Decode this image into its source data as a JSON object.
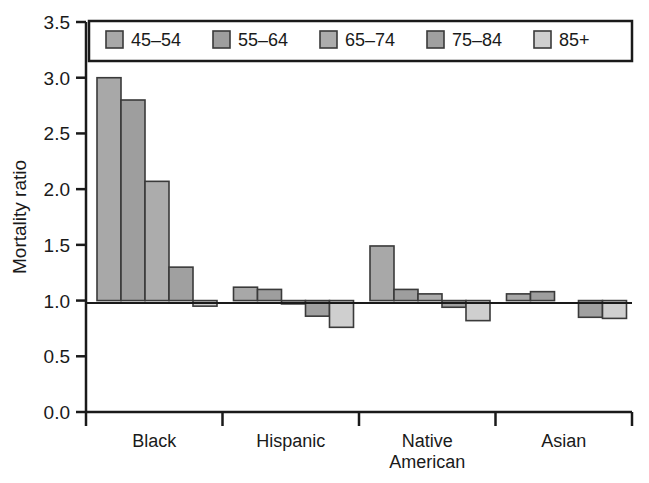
{
  "chart_data": {
    "type": "bar",
    "title": "",
    "subtitle": "",
    "xlabel": "",
    "ylabel": "Mortality ratio",
    "ylim": [
      0.0,
      3.5
    ],
    "ytick_labels": [
      "0.0",
      "0.5",
      "1.0",
      "1.5",
      "2.0",
      "2.5",
      "3.0",
      "3.5"
    ],
    "ytick_values": [
      0.0,
      0.5,
      1.0,
      1.5,
      2.0,
      2.5,
      3.0,
      3.5
    ],
    "grid": false,
    "legend_position": "top-inside",
    "reference_line": 1.0,
    "categories": [
      "Black",
      "Hispanic",
      "Native American",
      "Asian"
    ],
    "category_label_lines": [
      [
        "Black"
      ],
      [
        "Hispanic"
      ],
      [
        "Native",
        "American"
      ],
      [
        "Asian"
      ]
    ],
    "series": [
      {
        "name": "45–54",
        "color": "#a8a8a8",
        "values": [
          3.0,
          1.12,
          1.49,
          1.06
        ]
      },
      {
        "name": "55–64",
        "color": "#9e9e9e",
        "values": [
          2.8,
          1.1,
          1.1,
          1.08
        ]
      },
      {
        "name": "65–74",
        "color": "#acacac",
        "values": [
          2.07,
          0.97,
          1.06,
          1.0
        ]
      },
      {
        "name": "75–84",
        "color": "#a0a0a0",
        "values": [
          1.3,
          0.86,
          0.94,
          0.85
        ]
      },
      {
        "name": "85+",
        "color": "#cfcfcf",
        "values": [
          0.95,
          0.76,
          0.82,
          0.84
        ]
      }
    ]
  },
  "legend": {
    "items": [
      {
        "label": "45–54",
        "color": "#a8a8a8"
      },
      {
        "label": "55–64",
        "color": "#9e9e9e"
      },
      {
        "label": "65–74",
        "color": "#acacac"
      },
      {
        "label": "75–84",
        "color": "#a0a0a0"
      },
      {
        "label": "85+",
        "color": "#cfcfcf"
      }
    ]
  },
  "axes": {
    "y_title": "Mortality ratio"
  },
  "colors": {
    "axis": "#1a1a1a",
    "bar_outline": "#3a3a3a",
    "background": "#ffffff"
  }
}
